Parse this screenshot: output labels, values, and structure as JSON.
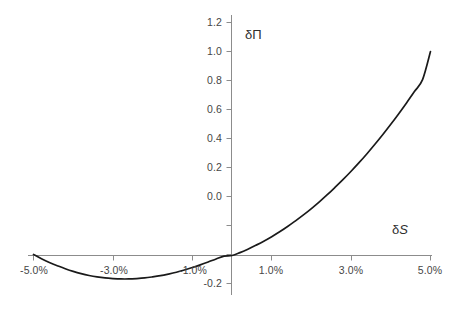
{
  "chart_data": {
    "type": "line",
    "title": "",
    "subtitle": "",
    "xlabel": "δS",
    "ylabel": "δΠ",
    "xlabel_parts": {
      "delta": "δ",
      "symbol": "S"
    },
    "ylabel_parts": {
      "delta": "δ",
      "symbol": "Π"
    },
    "x_unit": "percent",
    "xlim": [
      -0.06,
      0.055
    ],
    "ylim": [
      -0.2,
      1.2
    ],
    "x_ticks": [
      -0.05,
      -0.03,
      -0.01,
      0.01,
      0.03,
      0.05
    ],
    "x_tick_labels": [
      "-5.0%",
      "-3.0%",
      "-1.0%",
      "1.0%",
      "3.0%",
      "5.0%"
    ],
    "y_ticks": [
      -0.2,
      0.0,
      0.2,
      0.4,
      0.6,
      0.8,
      1.0,
      1.2
    ],
    "y_tick_labels": [
      "-0.2",
      "0.0",
      "0.2",
      "0.4",
      "0.6",
      "0.8",
      "1.0",
      "1.2"
    ],
    "grid": false,
    "legend": null,
    "legend_position": "none",
    "axis_line_color": "#8c8c8c",
    "curve_color": "#1a1a1a",
    "series": [
      {
        "name": "δΠ",
        "x": [
          -0.05,
          -0.048,
          -0.046,
          -0.044,
          -0.042,
          -0.04,
          -0.038,
          -0.036,
          -0.034,
          -0.032,
          -0.03,
          -0.028,
          -0.026,
          -0.024,
          -0.022,
          -0.02,
          -0.018,
          -0.016,
          -0.014,
          -0.012,
          -0.01,
          -0.008,
          -0.006,
          -0.004,
          -0.002,
          0.0,
          0.002,
          0.004,
          0.006,
          0.008,
          0.01,
          0.012,
          0.014,
          0.016,
          0.018,
          0.02,
          0.022,
          0.024,
          0.026,
          0.028,
          0.03,
          0.032,
          0.034,
          0.036,
          0.038,
          0.04,
          0.042,
          0.044,
          0.046,
          0.048,
          0.05
        ],
        "y": [
          0.005,
          -0.016,
          -0.034,
          -0.05,
          -0.065,
          -0.078,
          -0.089,
          -0.098,
          -0.105,
          -0.11,
          -0.113,
          -0.115,
          -0.115,
          -0.113,
          -0.11,
          -0.105,
          -0.099,
          -0.091,
          -0.082,
          -0.071,
          -0.059,
          -0.046,
          -0.032,
          -0.017,
          -0.003,
          0.0,
          0.014,
          0.031,
          0.05,
          0.07,
          0.092,
          0.116,
          0.142,
          0.17,
          0.199,
          0.23,
          0.263,
          0.298,
          0.335,
          0.373,
          0.413,
          0.455,
          0.499,
          0.545,
          0.593,
          0.643,
          0.695,
          0.749,
          0.805,
          0.862,
          1.0
        ]
      }
    ],
    "annotations": {
      "minimum_x": "-2.7%",
      "minimum_y": "-0.115",
      "endpoint_right_y": "1.0",
      "endpoint_left_y": "0.0"
    }
  },
  "y_tick_positions": [
    {
      "label": "1.2",
      "top": 16
    },
    {
      "label": "1.0",
      "top": 45
    },
    {
      "label": "0.8",
      "top": 74
    },
    {
      "label": "0.6",
      "top": 103
    },
    {
      "label": "0.4",
      "top": 132
    },
    {
      "label": "0.2",
      "top": 161
    },
    {
      "label": "0.0",
      "top": 190
    },
    {
      "label": "-0.2",
      "top": 219
    }
  ],
  "x_tick_positions": [
    {
      "label": "-5.0%",
      "left": 33
    },
    {
      "label": "-3.0%",
      "left": 113
    },
    {
      "label": "-1.0%",
      "left": 192
    },
    {
      "label": "1.0%",
      "left": 271
    },
    {
      "label": "3.0%",
      "left": 351
    },
    {
      "label": "5.0%",
      "left": 430
    }
  ]
}
